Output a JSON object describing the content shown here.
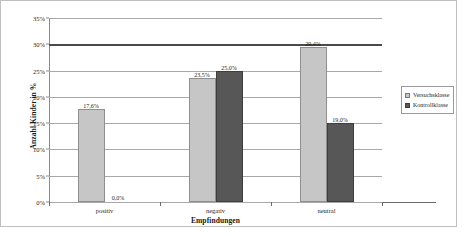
{
  "chart_data": {
    "type": "bar",
    "title": "",
    "xlabel": "Empfindungen",
    "ylabel": "Anzahl Kinder in %",
    "categories": [
      "positiv",
      "negativ",
      "neutral"
    ],
    "series": [
      {
        "name": "Versuchsklasse",
        "color": "#c6c6c6",
        "values": [
          17.6,
          23.5,
          29.4
        ],
        "labels": [
          "17,6%",
          "23,5%",
          "29,4%"
        ]
      },
      {
        "name": "Kontrollklasse",
        "color": "#575757",
        "values": [
          0.0,
          25.0,
          15.0
        ],
        "labels": [
          "0,0%",
          "25,0%",
          "19,0%"
        ]
      }
    ],
    "ylim": [
      0,
      35
    ],
    "y_ticks": [
      0,
      5,
      10,
      15,
      20,
      25,
      30,
      35
    ],
    "y_tick_labels": [
      "0%",
      "5%",
      "10%",
      "15%",
      "20%",
      "25%",
      "30%",
      "35%"
    ],
    "grid": true,
    "legend_position": "right"
  },
  "legend": {
    "items": [
      {
        "label": "Versuchsklasse"
      },
      {
        "label": "Kontrollklasse"
      }
    ]
  }
}
